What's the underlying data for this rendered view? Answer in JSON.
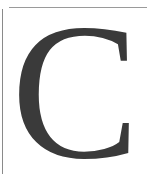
{
  "image": {
    "type": "decorative-drop-cap",
    "letter": "C",
    "colors": {
      "letter": "#3a3a3a",
      "frame": "#9a9a9a",
      "background": "#ffffff"
    }
  }
}
